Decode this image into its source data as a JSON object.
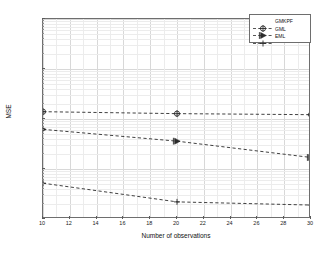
{
  "chart_data": {
    "type": "line",
    "title": "",
    "xlabel": "Number of observations",
    "ylabel": "MSE",
    "x": [
      10,
      20,
      30
    ],
    "xlim": [
      10,
      30
    ],
    "ylim": [
      0.0001,
      1
    ],
    "yscale": "log",
    "xscale": "linear",
    "grid": true,
    "legend_position": "top-right",
    "xticks": [
      "10",
      "12",
      "14",
      "16",
      "18",
      "20",
      "22",
      "24",
      "26",
      "28",
      "30"
    ],
    "xtick_values": [
      10,
      12,
      14,
      16,
      18,
      20,
      22,
      24,
      26,
      28,
      30
    ],
    "ytick_labels": [
      "10",
      "10",
      "10",
      "10",
      "10"
    ],
    "ytick_exponents": [
      "0",
      "-1",
      "-2",
      "-3",
      "-4"
    ],
    "ytick_values": [
      1,
      0.1,
      0.01,
      0.001,
      0.0001
    ],
    "series": [
      {
        "name": "GMKPF",
        "marker": "circle-plus",
        "linestyle": "dashed",
        "color": "#2b2b2b",
        "values": [
          0.014,
          0.0128,
          0.0122
        ]
      },
      {
        "name": "GML",
        "marker": "right-triangle",
        "linestyle": "dashed",
        "color": "#2b2b2b",
        "values": [
          0.0062,
          0.0036,
          0.0017
        ]
      },
      {
        "name": "EML",
        "marker": "plus",
        "linestyle": "dashed",
        "color": "#2b2b2b",
        "values": [
          0.00052,
          0.00022,
          0.00019
        ]
      }
    ]
  },
  "legend": {
    "entries": [
      {
        "label": "GMKPF"
      },
      {
        "label": "GML"
      },
      {
        "label": "EML"
      }
    ]
  },
  "axes": {
    "x_title": "Number of observations",
    "y_title": "MSE"
  },
  "colors": {
    "frame": "#6e6e6e",
    "grid_major": "#d8d8d8",
    "grid_minor": "#ececec",
    "line": "#2b2b2b",
    "background": "#ffffff"
  }
}
